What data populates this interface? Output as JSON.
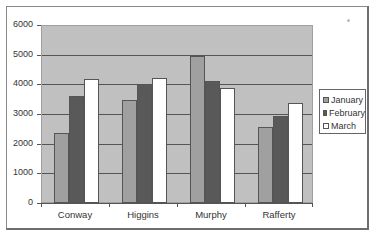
{
  "chart_data": {
    "type": "bar",
    "title": "",
    "xlabel": "",
    "ylabel": "",
    "categories": [
      "Conway",
      "Higgins",
      "Murphy",
      "Rafferty"
    ],
    "series": [
      {
        "name": "January",
        "color": "#a0a0a0",
        "values": [
          2350,
          3470,
          4950,
          2560
        ]
      },
      {
        "name": "February",
        "color": "#595959",
        "values": [
          3620,
          4000,
          4110,
          2930
        ]
      },
      {
        "name": "March",
        "color": "#ffffff",
        "values": [
          4170,
          4210,
          3860,
          3360
        ]
      }
    ],
    "ylim": [
      0,
      6000
    ],
    "yticks": [
      "0",
      "1000",
      "2000",
      "3000",
      "4000",
      "5000",
      "6000"
    ],
    "grid": true,
    "legend_position": "right",
    "plot_background": "#c0c0c0"
  },
  "legend": {
    "items": [
      {
        "label": "January",
        "color": "#a0a0a0"
      },
      {
        "label": "February",
        "color": "#595959"
      },
      {
        "label": "March",
        "color": "#ffffff"
      }
    ]
  }
}
